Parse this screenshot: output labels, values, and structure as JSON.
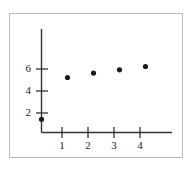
{
  "chart_data": {
    "type": "scatter",
    "title": "",
    "xlabel": "",
    "ylabel": "",
    "x": [
      0,
      1,
      2,
      3,
      4
    ],
    "values": [
      1.2,
      5.0,
      5.4,
      5.7,
      6.0
    ],
    "series": [
      {
        "name": "",
        "points": [
          {
            "x": 0,
            "y": 1.2
          },
          {
            "x": 1,
            "y": 5.0
          },
          {
            "x": 2,
            "y": 5.4
          },
          {
            "x": 3,
            "y": 5.7
          },
          {
            "x": 4,
            "y": 6.0
          }
        ]
      }
    ],
    "xlim": [
      0,
      5.0
    ],
    "ylim": [
      0,
      7.5
    ],
    "xticks": [
      1,
      2,
      3,
      4
    ],
    "yticks": [
      2,
      4,
      6
    ],
    "xtick_labels": [
      "1",
      "2",
      "3",
      "4"
    ],
    "ytick_labels": [
      "2",
      "4",
      "6"
    ],
    "grid": false,
    "legend": false,
    "marker": "filled-circle",
    "marker_color": "#1a1a1a",
    "axis_color": "#333333",
    "frame_color": "#b9b9b9",
    "background": "#ffffff"
  },
  "axes": {
    "y_tick_labels": [
      {
        "text": "6",
        "top": 63
      },
      {
        "text": "4",
        "top": 85
      },
      {
        "text": "2",
        "top": 107
      }
    ],
    "x_tick_labels": [
      {
        "text": "1",
        "left": 55
      },
      {
        "text": "2",
        "left": 81
      },
      {
        "text": "3",
        "left": 107
      },
      {
        "text": "4",
        "left": 133
      }
    ]
  }
}
